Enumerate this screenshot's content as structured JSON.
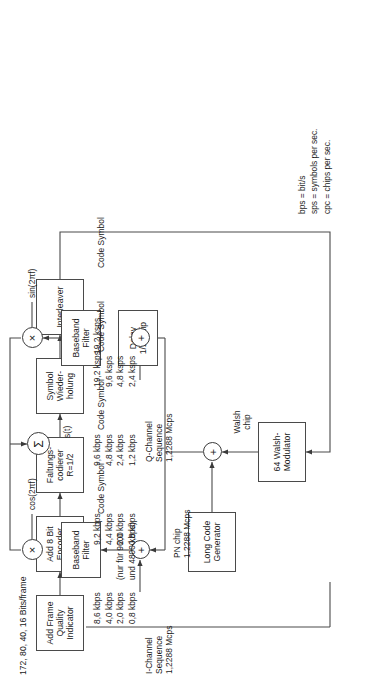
{
  "diagram": {
    "header_note": "172, 80, 40, 16 Bits/frame",
    "output_signal": "s(t)"
  },
  "blocks": [
    {
      "id": "frame_quality",
      "lines": [
        "Add Frame",
        "Quality",
        "Indicator"
      ]
    },
    {
      "id": "encoder_tail",
      "lines": [
        "Add 8 Bit",
        "Encoder",
        "Tail"
      ]
    },
    {
      "id": "conv_coder",
      "lines": [
        "Faltungs-",
        "codierer",
        "R=1/2"
      ]
    },
    {
      "id": "symbol_rep",
      "lines": [
        "Symbol",
        "Wieder-",
        "holung"
      ]
    },
    {
      "id": "interleaver",
      "lines": [
        "Interleaver"
      ]
    },
    {
      "id": "walsh_mod",
      "lines": [
        "64 Walsh-",
        "Modulator"
      ]
    },
    {
      "id": "long_code",
      "lines": [
        "Long Code",
        "Generator"
      ]
    },
    {
      "id": "bb_filter_i",
      "lines": [
        "Baseband",
        "Filter"
      ]
    },
    {
      "id": "bb_filter_q",
      "lines": [
        "Baseband",
        "Filter"
      ]
    },
    {
      "id": "delay",
      "lines": [
        "Delay",
        "1/2 Chip"
      ]
    }
  ],
  "nodes": {
    "walsh_sum": "+",
    "i_sum": "+",
    "q_sum": "+",
    "i_mixer": "×",
    "q_mixer": "×",
    "summer": "Σ"
  },
  "rates": {
    "input": [
      "8,6 kbps",
      "4,0 kbps",
      "2,0 kbps",
      "0,8 kbps"
    ],
    "input_note1": "(nur für 9600",
    "input_note2": "und 4800 kbps)",
    "after_fqi": [
      "9,2 kbps",
      "4,4 kbps",
      "2,0 kbps",
      "0,8 kbps"
    ],
    "after_tail": [
      "9,6 kbps",
      "4,8 kbps",
      "2,4 kbps",
      "1,2 kbps"
    ],
    "after_coder": [
      "19,2 ksps",
      "9,6 ksps",
      "4,8 ksps",
      "2,4 ksps"
    ],
    "after_repetition": "19,2 ksps"
  },
  "annotations": {
    "code_symbol_1": "Code Symbol",
    "code_symbol_2": "Code Symbol",
    "code_symbol_3": "Code Symbol",
    "code_symbol_4": "Code Symbol",
    "walsh_chip_l1": "Walsh",
    "walsh_chip_l2": "chip",
    "pn_chip_l1": "PN chip",
    "pn_chip_l2": "1,2288 Mcps",
    "i_channel_l1": "I-Channel",
    "i_channel_l2": "Sequence",
    "i_channel_rate": "1,2288 Mcps",
    "q_channel_l1": "Q-Channel",
    "q_channel_l2": "Sequence",
    "q_channel_rate": "1,2288 Mcps",
    "cos_carrier": "cos(2πf)",
    "sin_carrier": "sin(2πf)"
  },
  "legend": [
    "bps = bit/s",
    "sps = symbols per sec.",
    "cpc = chips per sec."
  ],
  "colors": {
    "line": "#4a4a4a",
    "text": "#1a1a1a",
    "background": "#ffffff"
  }
}
